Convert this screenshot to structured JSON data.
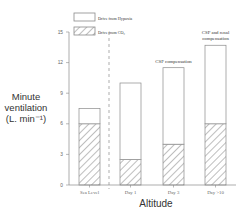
{
  "chart_data": {
    "type": "bar",
    "stacked": true,
    "title": "",
    "xlabel": "Altitude",
    "ylabel_lines": [
      "Minute",
      "ventilation",
      "(L. min⁻¹)"
    ],
    "ylabel": "Minute ventilation (L. min-1)",
    "ylim": [
      0,
      15
    ],
    "yticks": [
      0,
      3,
      6,
      9,
      12,
      15
    ],
    "grid": false,
    "legend_position": "top-left",
    "categories": [
      "Sea Level",
      "Day 1",
      "Day 3",
      "Day >10"
    ],
    "series": [
      {
        "name": "Drive from CO₂",
        "pattern": "hatched",
        "values": [
          6.0,
          2.5,
          4.0,
          6.0
        ]
      },
      {
        "name": "Drive from Hypoxia",
        "pattern": "open",
        "values": [
          1.5,
          7.5,
          7.5,
          7.7
        ]
      }
    ],
    "totals": [
      7.5,
      10.0,
      11.5,
      13.7
    ],
    "annotations": [
      {
        "category": "Day 3",
        "lines": [
          "CSF  compensation"
        ]
      },
      {
        "category": "Day >10",
        "lines": [
          "CSF and renal",
          "compensation"
        ]
      }
    ],
    "separator": {
      "type": "dashed-vertical",
      "between": [
        "Sea Level",
        "Day 1"
      ]
    }
  },
  "legend": {
    "items": [
      {
        "label": "Drive from Hypoxia",
        "pattern": "open"
      },
      {
        "label": "Drive from CO₂",
        "pattern": "hatched"
      }
    ]
  },
  "axes": {
    "xlabel": "Altitude",
    "ylabel": [
      "Minute",
      "ventilation",
      "(L. min⁻¹)"
    ]
  },
  "colors": {
    "stroke": "#8a8a8a",
    "hatch": "#6f6f6f",
    "text": "#333333",
    "tick_text": "#666666"
  }
}
